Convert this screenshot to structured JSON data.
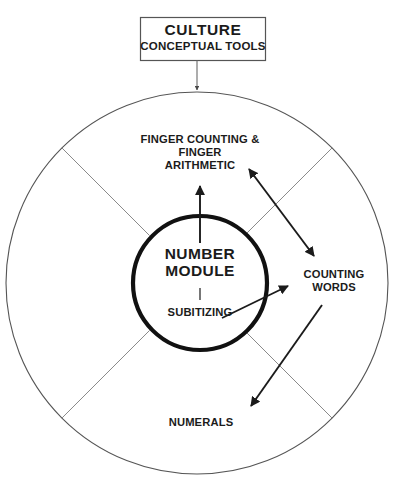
{
  "diagram": {
    "colors": {
      "background": "#ffffff",
      "text": "#1b1b1b",
      "outer_circle_stroke": "#555555",
      "inner_circle_stroke": "#111111",
      "spoke_stroke": "#777777",
      "arrow_stroke": "#1b1b1b",
      "box_stroke": "#555555"
    },
    "culture_box": {
      "title": "CULTURE",
      "subtitle": "CONCEPTUAL TOOLS"
    },
    "core": {
      "title_line1": "NUMBER",
      "title_line2": "MODULE",
      "title": "NUMBER MODULE",
      "divider": "|",
      "subtitle": "SUBITIZING"
    },
    "sectors": [
      {
        "id": "finger",
        "label": "FINGER COUNTING &\nFINGER\nARITHMETIC",
        "position": "top"
      },
      {
        "id": "counting-words",
        "label": "COUNTING\nWORDS",
        "position": "right"
      },
      {
        "id": "numerals",
        "label": "NUMERALS",
        "position": "bottom"
      }
    ],
    "connectors": [
      {
        "id": "culture-to-circle",
        "type": "single-arrow",
        "from": "CULTURE",
        "to": "outer circle"
      },
      {
        "id": "core-to-finger",
        "type": "single-arrow",
        "from": "NUMBER MODULE",
        "to": "FINGER COUNTING & FINGER ARITHMETIC"
      },
      {
        "id": "core-to-counting-words",
        "type": "single-arrow",
        "from": "NUMBER MODULE",
        "to": "COUNTING WORDS"
      },
      {
        "id": "finger-counting-words",
        "type": "double-arrow",
        "from": "FINGER ARITHMETIC",
        "to": "COUNTING WORDS"
      },
      {
        "id": "counting-words-to-numerals",
        "type": "single-arrow",
        "from": "COUNTING WORDS",
        "to": "NUMERALS"
      }
    ]
  }
}
